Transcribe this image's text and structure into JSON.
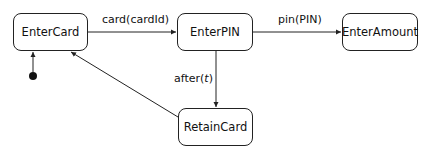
{
  "diagram": {
    "type": "state-machine",
    "states": [
      {
        "id": "EnterCard",
        "label": "EnterCard"
      },
      {
        "id": "EnterPIN",
        "label": "EnterPIN"
      },
      {
        "id": "EnterAmount",
        "label": "EnterAmount"
      },
      {
        "id": "RetainCard",
        "label": "RetainCard"
      }
    ],
    "initial_state": "EnterCard",
    "transitions": [
      {
        "from": "EnterCard",
        "to": "EnterPIN",
        "label": "card(cardId)"
      },
      {
        "from": "EnterPIN",
        "to": "EnterAmount",
        "label": "pin(PIN)"
      },
      {
        "from": "EnterPIN",
        "to": "RetainCard",
        "label_prefix": "after(",
        "label_var": "t",
        "label_suffix": ")"
      },
      {
        "from": "RetainCard",
        "to": "EnterCard",
        "label": ""
      }
    ],
    "colors": {
      "stroke": "#222222",
      "background": "#ffffff",
      "text": "#111111"
    }
  }
}
